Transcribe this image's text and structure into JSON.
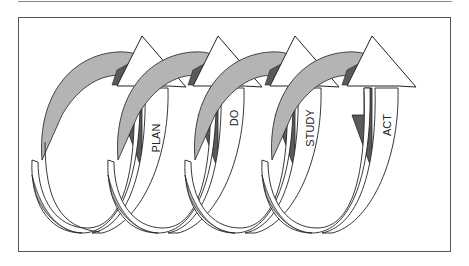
{
  "diagram": {
    "type": "PDSA cycle spiral",
    "stages": [
      {
        "label": "PLAN"
      },
      {
        "label": "DO"
      },
      {
        "label": "STUDY"
      },
      {
        "label": "ACT"
      }
    ],
    "colors": {
      "light_band": "#b4b4b4",
      "dark_band": "#5a5a5a",
      "arrow_fill": "#ffffff",
      "outline": "#222222",
      "frame": "#555555"
    }
  }
}
